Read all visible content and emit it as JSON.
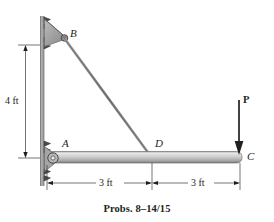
{
  "figure": {
    "caption": "Probs. 8–14/15",
    "points": {
      "A": "A",
      "B": "B",
      "C": "C",
      "D": "D"
    },
    "load_label": "P",
    "dimensions": {
      "vertical": "4 ft",
      "horizontal_left": "3 ft",
      "horizontal_right": "3 ft"
    },
    "colors": {
      "line": "#231f20",
      "member_light": "#d4d4d4",
      "member_mid": "#a9a9a9",
      "member_dark": "#6e6e6e",
      "gusset": "#9a9a9a",
      "wall": "#8a8a8a",
      "dimension": "#3a3a3a"
    },
    "geometry": {
      "wall_x": 42,
      "B_y": 35,
      "A_y": 158,
      "D_x": 152,
      "C_x": 240
    }
  }
}
